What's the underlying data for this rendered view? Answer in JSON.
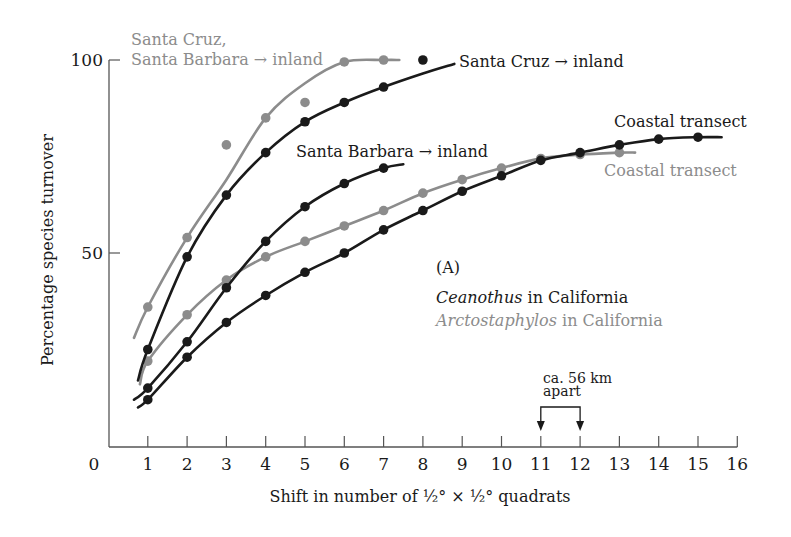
{
  "chart_data": {
    "type": "line",
    "panel_label": "(A)",
    "xlabel": "Shift in number of ½° × ½° quadrats",
    "ylabel": "Percentage species turnover",
    "xlim": [
      0,
      16
    ],
    "ylim": [
      0,
      100
    ],
    "x_ticks": [
      "0",
      "1",
      "2",
      "3",
      "4",
      "5",
      "6",
      "7",
      "8",
      "9",
      "10",
      "11",
      "12",
      "13",
      "14",
      "15",
      "16"
    ],
    "y_ticks": [
      {
        "value": 50,
        "label": "50"
      },
      {
        "value": 100,
        "label": "100"
      }
    ],
    "grid": false,
    "legend": [
      {
        "genus": "Ceanothus",
        "suffix": " in California",
        "color": "#1a1a1a"
      },
      {
        "genus": "Arctostaphylos",
        "suffix": " in California",
        "color": "#8c8c8c"
      }
    ],
    "series": [
      {
        "name": "Santa Cruz, Santa Barbara → inland",
        "label_lines": [
          "Santa Cruz,",
          "Santa Barbara → inland"
        ],
        "taxon": "Arctostaphylos",
        "color": "#8c8c8c",
        "curve": [
          [
            0.65,
            28
          ],
          [
            1,
            36
          ],
          [
            2,
            54
          ],
          [
            3,
            69
          ],
          [
            4,
            85
          ],
          [
            5,
            94
          ],
          [
            6,
            99.5
          ],
          [
            7,
            100
          ],
          [
            7.4,
            100
          ]
        ],
        "points": [
          [
            1,
            36
          ],
          [
            2,
            54
          ],
          [
            3,
            78
          ],
          [
            4,
            85
          ],
          [
            5,
            89
          ],
          [
            6,
            99.5
          ],
          [
            7,
            100
          ]
        ]
      },
      {
        "name": "Santa Cruz → inland",
        "label_lines": [
          "Santa Cruz → inland"
        ],
        "taxon": "Ceanothus",
        "color": "#1a1a1a",
        "curve": [
          [
            0.75,
            17
          ],
          [
            1,
            25
          ],
          [
            2,
            49
          ],
          [
            3,
            65
          ],
          [
            4,
            76
          ],
          [
            5,
            84
          ],
          [
            6,
            89
          ],
          [
            7,
            93
          ],
          [
            8,
            96.5
          ],
          [
            8.8,
            99
          ]
        ],
        "points": [
          [
            1,
            25
          ],
          [
            2,
            49
          ],
          [
            3,
            65
          ],
          [
            4,
            76
          ],
          [
            5,
            84
          ],
          [
            6,
            89
          ],
          [
            7,
            93
          ],
          [
            8,
            100
          ]
        ]
      },
      {
        "name": "Santa Barbara → inland",
        "label_lines": [
          "Santa Barbara → inland"
        ],
        "taxon": "Ceanothus",
        "color": "#1a1a1a",
        "curve": [
          [
            0.65,
            12
          ],
          [
            1,
            15
          ],
          [
            2,
            27
          ],
          [
            3,
            41
          ],
          [
            4,
            53
          ],
          [
            5,
            62
          ],
          [
            6,
            68
          ],
          [
            7,
            72
          ],
          [
            7.5,
            73
          ]
        ],
        "points": [
          [
            1,
            15
          ],
          [
            2,
            27
          ],
          [
            3,
            41
          ],
          [
            4,
            53
          ],
          [
            5,
            62
          ],
          [
            6,
            68
          ],
          [
            7,
            72
          ]
        ]
      },
      {
        "name": "Coastal transect (Arctostaphylos)",
        "label_lines": [
          "Coastal transect"
        ],
        "taxon": "Arctostaphylos",
        "color": "#8c8c8c",
        "curve": [
          [
            0.8,
            16
          ],
          [
            1,
            22
          ],
          [
            2,
            34
          ],
          [
            3,
            43
          ],
          [
            4,
            49
          ],
          [
            5,
            53
          ],
          [
            6,
            57
          ],
          [
            7,
            61
          ],
          [
            8,
            65.5
          ],
          [
            9,
            69
          ],
          [
            10,
            72
          ],
          [
            11,
            74.5
          ],
          [
            12,
            75.5
          ],
          [
            13,
            76
          ],
          [
            13.4,
            76
          ]
        ],
        "points": [
          [
            1,
            22
          ],
          [
            2,
            34
          ],
          [
            3,
            43
          ],
          [
            4,
            49
          ],
          [
            5,
            53
          ],
          [
            6,
            57
          ],
          [
            7,
            61
          ],
          [
            8,
            65.5
          ],
          [
            9,
            69
          ],
          [
            10,
            72
          ],
          [
            11,
            74.5
          ],
          [
            12,
            75.5
          ],
          [
            13,
            76
          ]
        ]
      },
      {
        "name": "Coastal transect (Ceanothus)",
        "label_lines": [
          "Coastal transect"
        ],
        "taxon": "Ceanothus",
        "color": "#1a1a1a",
        "curve": [
          [
            0.75,
            10
          ],
          [
            1,
            12
          ],
          [
            2,
            23
          ],
          [
            3,
            32
          ],
          [
            4,
            39
          ],
          [
            5,
            45
          ],
          [
            6,
            50
          ],
          [
            7,
            56
          ],
          [
            8,
            61
          ],
          [
            9,
            66
          ],
          [
            10,
            70
          ],
          [
            11,
            74
          ],
          [
            12,
            76
          ],
          [
            13,
            78
          ],
          [
            14,
            79.5
          ],
          [
            15,
            80
          ],
          [
            15.6,
            80
          ]
        ],
        "points": [
          [
            1,
            12
          ],
          [
            2,
            23
          ],
          [
            3,
            32
          ],
          [
            4,
            39
          ],
          [
            5,
            45
          ],
          [
            6,
            50
          ],
          [
            7,
            56
          ],
          [
            8,
            61
          ],
          [
            9,
            66
          ],
          [
            10,
            70
          ],
          [
            11,
            74
          ],
          [
            12,
            76
          ],
          [
            13,
            78
          ],
          [
            14,
            79.5
          ],
          [
            15,
            80
          ]
        ]
      }
    ],
    "annotation": {
      "lines": [
        "ca. 56 km",
        "apart"
      ],
      "from_x": 11,
      "to_x": 12
    }
  }
}
